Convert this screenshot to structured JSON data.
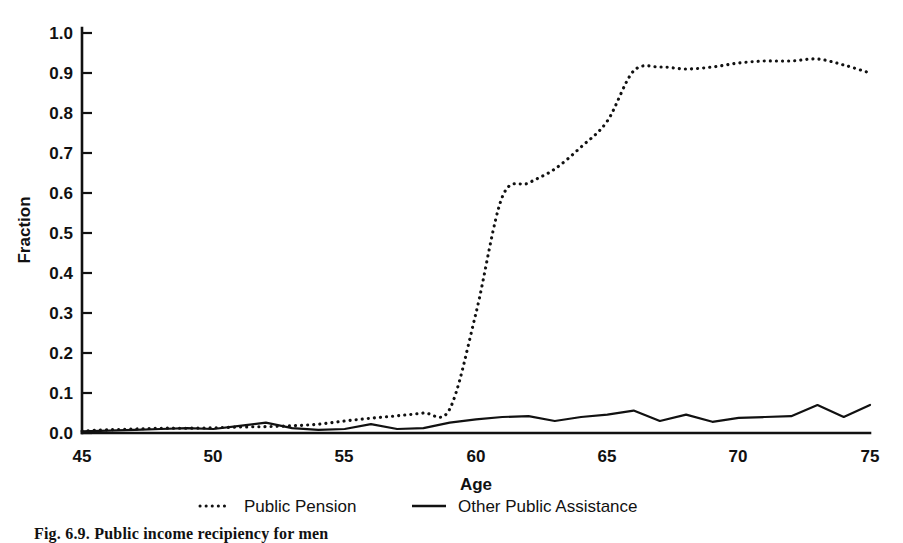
{
  "figure": {
    "caption": "Fig. 6.9.  Public income recipiency for men"
  },
  "chart_data": {
    "type": "line",
    "title": "",
    "xlabel": "Age",
    "ylabel": "Fraction",
    "xlim": [
      45,
      75
    ],
    "ylim": [
      0.0,
      1.0
    ],
    "grid": false,
    "legend_position": "bottom",
    "xticks": [
      "45",
      "50",
      "55",
      "60",
      "65",
      "70",
      "75"
    ],
    "xtick_values": [
      45,
      50,
      55,
      60,
      65,
      70,
      75
    ],
    "yticks": [
      "0.0",
      "0.1",
      "0.2",
      "0.3",
      "0.4",
      "0.5",
      "0.6",
      "0.7",
      "0.8",
      "0.9",
      "1.0"
    ],
    "ytick_values": [
      0.0,
      0.1,
      0.2,
      0.3,
      0.4,
      0.5,
      0.6,
      0.7,
      0.8,
      0.9,
      1.0
    ],
    "x": [
      45,
      46,
      47,
      48,
      49,
      50,
      51,
      52,
      53,
      54,
      55,
      56,
      57,
      58,
      59,
      60,
      61,
      62,
      63,
      64,
      65,
      66,
      67,
      68,
      69,
      70,
      71,
      72,
      73,
      74,
      75
    ],
    "series": [
      {
        "name": "Public Pension",
        "style": "dotted",
        "color": "#111111",
        "values": [
          0.005,
          0.008,
          0.01,
          0.012,
          0.012,
          0.013,
          0.015,
          0.016,
          0.018,
          0.022,
          0.03,
          0.037,
          0.043,
          0.05,
          0.06,
          0.3,
          0.59,
          0.625,
          0.66,
          0.715,
          0.78,
          0.905,
          0.915,
          0.91,
          0.915,
          0.925,
          0.93,
          0.93,
          0.935,
          0.92,
          0.9
        ]
      },
      {
        "name": "Other Public Assistance",
        "style": "solid",
        "color": "#111111",
        "values": [
          0.004,
          0.006,
          0.008,
          0.01,
          0.012,
          0.01,
          0.018,
          0.026,
          0.012,
          0.008,
          0.01,
          0.022,
          0.01,
          0.012,
          0.026,
          0.034,
          0.04,
          0.042,
          0.03,
          0.04,
          0.046,
          0.056,
          0.03,
          0.046,
          0.028,
          0.038,
          0.04,
          0.042,
          0.07,
          0.04,
          0.07
        ]
      }
    ],
    "baseline_series": {
      "name": "axis-baseline",
      "value": 0.0
    },
    "legend": [
      {
        "label": "Public Pension",
        "style": "dotted"
      },
      {
        "label": "Other Public Assistance",
        "style": "solid"
      }
    ]
  }
}
